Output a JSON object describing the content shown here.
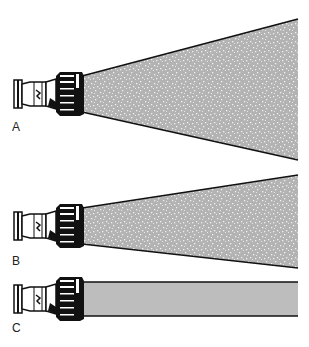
{
  "figure": {
    "colors": {
      "spray_fill": "#b3b3b3",
      "stream_fill": "#bdbdbd",
      "outline": "#111111",
      "nozzle": "#111111",
      "droplet": "#f2f2f2"
    },
    "panels": [
      {
        "label": "A",
        "pattern": "wide fog",
        "nozzle_y": 94,
        "left_top": 76,
        "left_bottom": 112,
        "right_top": 19,
        "right_bottom": 160,
        "label_y": 121
      },
      {
        "label": "B",
        "pattern": "narrow fog",
        "nozzle_y": 226,
        "left_top": 208,
        "left_bottom": 244,
        "right_top": 175,
        "right_bottom": 268,
        "label_y": 256
      },
      {
        "label": "C",
        "pattern": "straight stream",
        "nozzle_y": 299,
        "left_top": 282,
        "left_bottom": 316,
        "right_top": 282,
        "right_bottom": 316,
        "label_y": 323
      }
    ]
  }
}
